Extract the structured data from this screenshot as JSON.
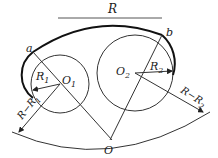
{
  "diagram": {
    "title_label": "R",
    "points": {
      "a": "a",
      "b": "b",
      "O": "O",
      "O1_main": "O",
      "O1_sub": "1",
      "O2_main": "O",
      "O2_sub": "2"
    },
    "dimensions": {
      "R1_main": "R",
      "R1_sub": "1",
      "R2_main": "R",
      "R2_sub": "2",
      "R_minus_R1_main": "R−R",
      "R_minus_R1_sub": "1",
      "R_minus_R2_main": "R−R",
      "R_minus_R2_sub": "2"
    },
    "colors": {
      "stroke": "#222222",
      "background": "#ffffff"
    }
  }
}
